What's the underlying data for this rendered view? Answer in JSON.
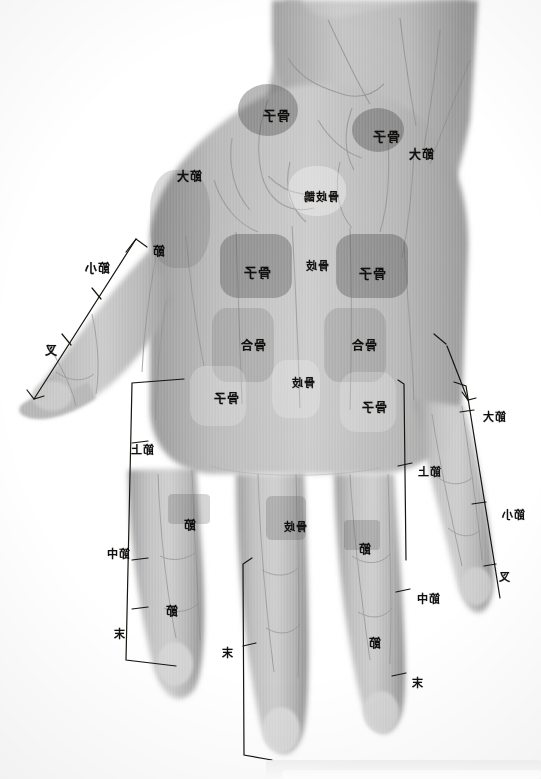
{
  "plate": {
    "title": "Hand radiograph with Chinese anatomical annotations",
    "orientation": "mirrored",
    "background_color": "#ffffff",
    "film_gray": "#bdbdbd",
    "ink_color": "#12100e"
  },
  "zone_labels": [
    {
      "id": "z1",
      "text": "骨子",
      "x": 262,
      "y": 105,
      "size": "fs13"
    },
    {
      "id": "z2",
      "text": "骨子",
      "x": 372,
      "y": 126,
      "size": "fs13"
    },
    {
      "id": "z3",
      "text": "節大",
      "x": 176,
      "y": 167,
      "size": "fs12"
    },
    {
      "id": "z4",
      "text": "骨歧鵲",
      "x": 303,
      "y": 188,
      "size": "fs11"
    },
    {
      "id": "z5",
      "text": "節",
      "x": 152,
      "y": 242,
      "size": "fs12"
    },
    {
      "id": "z6",
      "text": "骨子",
      "x": 243,
      "y": 262,
      "size": "fs13"
    },
    {
      "id": "z7",
      "text": "骨歧",
      "x": 305,
      "y": 257,
      "size": "fs11"
    },
    {
      "id": "z8",
      "text": "骨子",
      "x": 358,
      "y": 263,
      "size": "fs13"
    },
    {
      "id": "z9",
      "text": "骨合",
      "x": 240,
      "y": 336,
      "size": "fs12"
    },
    {
      "id": "z10",
      "text": "骨合",
      "x": 351,
      "y": 336,
      "size": "fs12"
    },
    {
      "id": "z11",
      "text": "骨子",
      "x": 213,
      "y": 389,
      "size": "fs12"
    },
    {
      "id": "z12",
      "text": "骨歧",
      "x": 291,
      "y": 374,
      "size": "fs11"
    },
    {
      "id": "z13",
      "text": "骨子",
      "x": 361,
      "y": 398,
      "size": "fs12"
    },
    {
      "id": "z14",
      "text": "節",
      "x": 183,
      "y": 516,
      "size": "fs12"
    },
    {
      "id": "z15",
      "text": "骨歧",
      "x": 283,
      "y": 518,
      "size": "fs11"
    },
    {
      "id": "z16",
      "text": "節",
      "x": 358,
      "y": 540,
      "size": "fs12"
    },
    {
      "id": "z17",
      "text": "節",
      "x": 165,
      "y": 602,
      "size": "fs12"
    },
    {
      "id": "z18",
      "text": "節",
      "x": 368,
      "y": 634,
      "size": "fs12"
    }
  ],
  "bracket_labels": [
    {
      "id": "b1",
      "text": "節小",
      "x": 84,
      "y": 259,
      "size": "fs12"
    },
    {
      "id": "b2",
      "text": "叉",
      "x": 44,
      "y": 341,
      "size": "fs12"
    },
    {
      "id": "b3",
      "text": "節上",
      "x": 130,
      "y": 441,
      "size": "fs11"
    },
    {
      "id": "b4",
      "text": "節中",
      "x": 106,
      "y": 545,
      "size": "fs11"
    },
    {
      "id": "b5",
      "text": "末",
      "x": 113,
      "y": 625,
      "size": "fs11"
    },
    {
      "id": "b6",
      "text": "末",
      "x": 221,
      "y": 644,
      "size": "fs11"
    },
    {
      "id": "b7",
      "text": "節大",
      "x": 482,
      "y": 408,
      "size": "fs11"
    },
    {
      "id": "b8",
      "text": "節上",
      "x": 417,
      "y": 463,
      "size": "fs11"
    },
    {
      "id": "b9",
      "text": "節小",
      "x": 501,
      "y": 506,
      "size": "fs11"
    },
    {
      "id": "b10",
      "text": "叉",
      "x": 498,
      "y": 568,
      "size": "fs11"
    },
    {
      "id": "b11",
      "text": "節中",
      "x": 416,
      "y": 590,
      "size": "fs11"
    },
    {
      "id": "b12",
      "text": "末",
      "x": 411,
      "y": 674,
      "size": "fs11"
    },
    {
      "id": "b13",
      "text": "節大",
      "x": 408,
      "y": 145,
      "size": "fs12"
    }
  ],
  "zones": [
    {
      "id": "r1",
      "tone": "dark",
      "x": 238,
      "y": 84,
      "w": 60,
      "h": 52,
      "radius": "50%"
    },
    {
      "id": "r2",
      "tone": "dark",
      "x": 352,
      "y": 108,
      "w": 52,
      "h": 44,
      "radius": "50%"
    },
    {
      "id": "r3",
      "tone": "light",
      "x": 288,
      "y": 166,
      "w": 58,
      "h": 50,
      "radius": "46%"
    },
    {
      "id": "r4",
      "tone": "dark",
      "x": 220,
      "y": 234,
      "w": 72,
      "h": 64,
      "radius": "26%"
    },
    {
      "id": "r5",
      "tone": "dark",
      "x": 336,
      "y": 234,
      "w": 72,
      "h": 64,
      "radius": "26%"
    },
    {
      "id": "r6",
      "tone": "mid",
      "x": 212,
      "y": 308,
      "w": 62,
      "h": 74,
      "radius": "24%"
    },
    {
      "id": "r7",
      "tone": "mid",
      "x": 324,
      "y": 308,
      "w": 62,
      "h": 74,
      "radius": "24%"
    },
    {
      "id": "r8",
      "tone": "pale",
      "x": 190,
      "y": 366,
      "w": 56,
      "h": 60,
      "radius": "28%"
    },
    {
      "id": "r9",
      "tone": "pale",
      "x": 272,
      "y": 360,
      "w": 48,
      "h": 58,
      "radius": "30%"
    },
    {
      "id": "r10",
      "tone": "pale",
      "x": 340,
      "y": 372,
      "w": 56,
      "h": 60,
      "radius": "28%"
    },
    {
      "id": "r11",
      "tone": "band",
      "x": 168,
      "y": 494,
      "w": 42,
      "h": 30,
      "radius": "12%"
    },
    {
      "id": "r12",
      "tone": "band",
      "x": 266,
      "y": 496,
      "w": 40,
      "h": 44,
      "radius": "14%"
    },
    {
      "id": "r13",
      "tone": "band",
      "x": 344,
      "y": 520,
      "w": 36,
      "h": 30,
      "radius": "12%"
    },
    {
      "id": "r14",
      "tone": "mid",
      "x": 150,
      "y": 170,
      "w": 60,
      "h": 98,
      "radius": "40%"
    }
  ],
  "accent": {
    "ink": "#12100e",
    "dark_zone": "rgba(74,74,74,0.40)",
    "light_zone": "rgba(255,255,255,0.34)"
  }
}
